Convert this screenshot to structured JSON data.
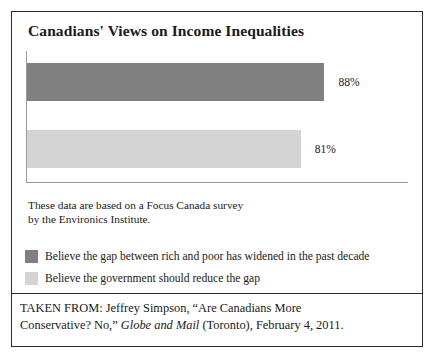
{
  "figure": {
    "title": "Canadians' Views on Income Inequalities",
    "source_note_line1": "These data are based on a Focus Canada survey",
    "source_note_line2": "by the Environics Institute.",
    "attribution_line1_prefix": "TAKEN FROM: Jeffrey Simpson, “Are Canadians More",
    "attribution_line2_prefix": "Conservative? No,” ",
    "attribution_italic": "Globe and Mail",
    "attribution_line2_suffix": " (Toronto), February 4, 2011."
  },
  "chart_data": {
    "type": "bar",
    "orientation": "horizontal",
    "title": "Canadians' Views on Income Inequalities",
    "xlabel": "",
    "ylabel": "",
    "xlim": [
      0,
      100
    ],
    "grid": false,
    "legend_position": "below",
    "categories": [
      "Believe the gap between rich and poor has widened in the past decade",
      "Believe the government should reduce the gap"
    ],
    "values": [
      88,
      81
    ],
    "value_labels": [
      "88%",
      "81%"
    ],
    "colors": [
      "#808080",
      "#d4d4d4"
    ],
    "series": [
      {
        "name": "Believe the gap between rich and poor has widened in the past decade",
        "value": 88,
        "label": "88%",
        "color": "#808080"
      },
      {
        "name": "Believe the government should reduce the gap",
        "value": 81,
        "label": "81%",
        "color": "#d4d4d4"
      }
    ],
    "annotations": [
      "These data are based on a Focus Canada survey by the Environics Institute."
    ]
  }
}
